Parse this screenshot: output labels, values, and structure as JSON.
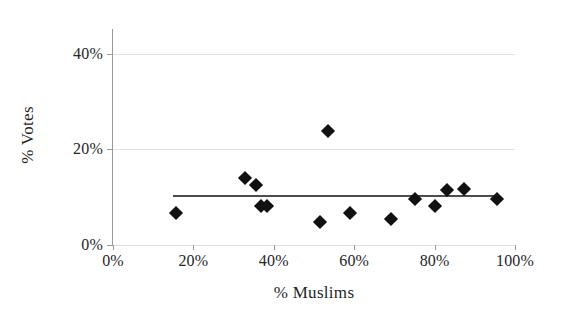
{
  "chart_data": {
    "type": "scatter",
    "title": "",
    "xlabel": "% Muslims",
    "ylabel": "% Votes",
    "xlim": [
      0,
      100
    ],
    "ylim": [
      0,
      45
    ],
    "grid": true,
    "legend": "none",
    "xticks": [
      {
        "value": 0,
        "label": "0%"
      },
      {
        "value": 20,
        "label": "20%"
      },
      {
        "value": 40,
        "label": "40%"
      },
      {
        "value": 60,
        "label": "60%"
      },
      {
        "value": 80,
        "label": "80%"
      },
      {
        "value": 100,
        "label": "100%"
      }
    ],
    "yticks": [
      {
        "value": 0,
        "label": "0%"
      },
      {
        "value": 20,
        "label": "20%"
      },
      {
        "value": 40,
        "label": "40%"
      }
    ],
    "marker": {
      "shape": "diamond",
      "color": "#111111",
      "size": 10
    },
    "points": [
      {
        "x": 15.7,
        "y": 6.7
      },
      {
        "x": 32.8,
        "y": 14.0
      },
      {
        "x": 35.6,
        "y": 12.5
      },
      {
        "x": 36.8,
        "y": 8.2
      },
      {
        "x": 38.4,
        "y": 8.2
      },
      {
        "x": 51.5,
        "y": 4.8
      },
      {
        "x": 53.5,
        "y": 23.8
      },
      {
        "x": 59.0,
        "y": 6.7
      },
      {
        "x": 69.2,
        "y": 5.4
      },
      {
        "x": 75.2,
        "y": 9.7
      },
      {
        "x": 80.0,
        "y": 8.2
      },
      {
        "x": 83.0,
        "y": 11.5
      },
      {
        "x": 87.4,
        "y": 11.8
      },
      {
        "x": 95.5,
        "y": 9.7
      }
    ],
    "trendline": {
      "x_start": 15.0,
      "x_end": 95.5,
      "y_start": 10.6,
      "y_end": 10.5,
      "color": "#4c4c4c"
    }
  }
}
